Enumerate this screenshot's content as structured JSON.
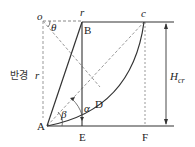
{
  "diagram": {
    "type": "slope-stability-critical-height",
    "points": {
      "o": "o",
      "r_top": "r",
      "B": "B",
      "c": "c",
      "D": "D",
      "A": "A",
      "E": "E",
      "F": "F"
    },
    "angles": {
      "theta": "θ",
      "beta": "β",
      "alpha": "α"
    },
    "radius_label": {
      "korean": "반경",
      "symbol": "r"
    },
    "height_label": {
      "main": "H",
      "subscript": "cr"
    },
    "colors": {
      "line": "#333333",
      "dashed": "#888888",
      "background": "#ffffff"
    }
  }
}
